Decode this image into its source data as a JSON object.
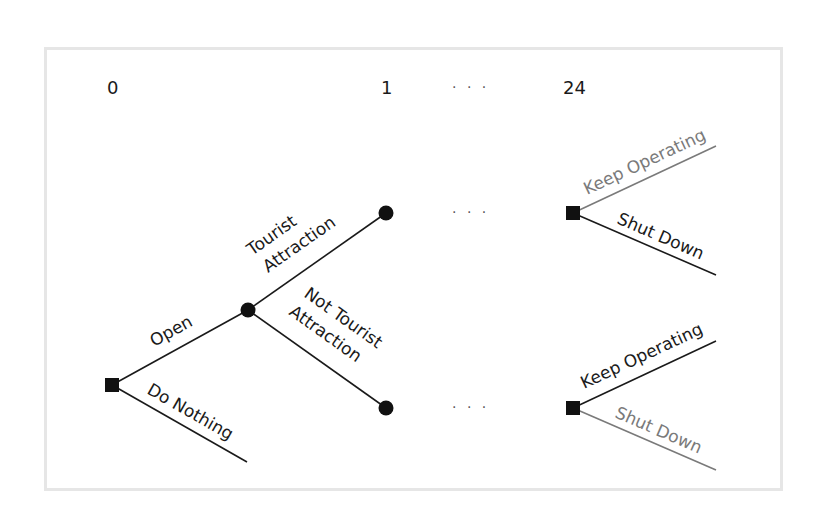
{
  "diagram": {
    "type": "decision-tree",
    "colors": {
      "frame": "#e6e6e6",
      "line_dark": "#1a1a1a",
      "line_gray": "#7a7a7a",
      "node": "#111111"
    },
    "header": {
      "stage_0": "0",
      "stage_1": "1",
      "ellipsis": "· · ·",
      "stage_24": "24"
    },
    "ellipsis_between": "· · ·",
    "nodes": {
      "root": {
        "kind": "decision",
        "shape": "square"
      },
      "chance": {
        "kind": "chance",
        "shape": "circle"
      },
      "tourist_end": {
        "kind": "chance",
        "shape": "circle"
      },
      "not_tourist_end": {
        "kind": "chance",
        "shape": "circle"
      },
      "upper_decision": {
        "kind": "decision",
        "shape": "square"
      },
      "lower_decision": {
        "kind": "decision",
        "shape": "square"
      }
    },
    "branches": {
      "open": "Open",
      "do_nothing": "Do Nothing",
      "tourist_line1": "Tourist",
      "tourist_line2": "Attraction",
      "not_tourist_line1": "Not Tourist",
      "not_tourist_line2": "Attraction",
      "upper_keep": "Keep Operating",
      "upper_shut": "Shut Down",
      "lower_keep": "Keep Operating",
      "lower_shut": "Shut Down"
    }
  }
}
